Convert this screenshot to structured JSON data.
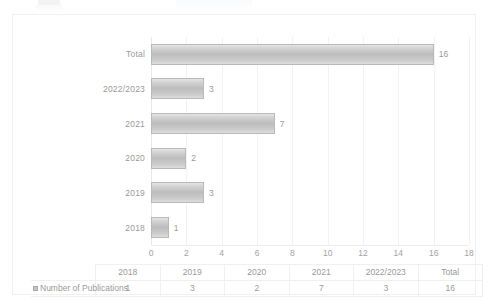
{
  "chart_data": {
    "type": "bar",
    "orientation": "horizontal",
    "title": "",
    "xlabel": "",
    "ylabel": "",
    "grid": true,
    "legend_position": "bottom-table",
    "xlim": [
      0,
      18
    ],
    "xticks": [
      "0",
      "2",
      "4",
      "6",
      "8",
      "10",
      "12",
      "14",
      "16",
      "18"
    ],
    "categories": [
      "2018",
      "2019",
      "2020",
      "2021",
      "2022/2023",
      "Total"
    ],
    "bar_order_top_to_bottom": [
      "Total",
      "2022/2023",
      "2021",
      "2020",
      "2019",
      "2018"
    ],
    "series": [
      {
        "name": "Number of Publications",
        "values": [
          1,
          3,
          2,
          7,
          3,
          16
        ]
      }
    ],
    "bars": [
      {
        "label": "Total",
        "value": 16,
        "value_label": "16"
      },
      {
        "label": "2022/2023",
        "value": 3,
        "value_label": "3"
      },
      {
        "label": "2021",
        "value": 7,
        "value_label": "7"
      },
      {
        "label": "2020",
        "value": 2,
        "value_label": "2"
      },
      {
        "label": "2019",
        "value": 3,
        "value_label": "3"
      },
      {
        "label": "2018",
        "value": 1,
        "value_label": "1"
      }
    ],
    "colors": {
      "bar_fill": "#c3c3c3",
      "bar_border": "#b9b9b9",
      "text": "#9a9a9a",
      "gridline": "#f2f2f3",
      "frame": "#f0f0f1",
      "background": "#ffffff"
    }
  },
  "data_table": {
    "header_blank": "",
    "columns": [
      "2018",
      "2019",
      "2020",
      "2021",
      "2022/2023",
      "Total"
    ],
    "row_label": "Number of Publications",
    "row_values": [
      "1",
      "3",
      "2",
      "7",
      "3",
      "16"
    ]
  }
}
